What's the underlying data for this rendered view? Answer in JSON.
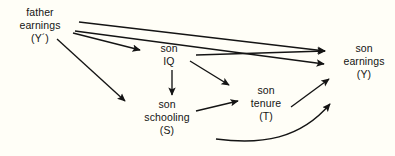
{
  "figure": {
    "type": "path-diagram",
    "background_color": "#fffef7",
    "stroke_color": "#141414",
    "text_color": "#141414"
  },
  "nodes": [
    {
      "id": "father-earnings",
      "lines": [
        "father",
        "earnings",
        "(Y´)"
      ],
      "label": "father earnings (Y´)",
      "symbol": "Y´"
    },
    {
      "id": "son-iq",
      "lines": [
        "son",
        "IQ",
        ""
      ],
      "label": "son IQ",
      "symbol": ""
    },
    {
      "id": "son-schooling",
      "lines": [
        "son",
        "schooling",
        "(S)"
      ],
      "label": "son schooling (S)",
      "symbol": "S"
    },
    {
      "id": "son-tenure",
      "lines": [
        "son",
        "tenure",
        "(T)"
      ],
      "label": "son tenure (T)",
      "symbol": "T"
    },
    {
      "id": "son-earnings",
      "lines": [
        "son",
        "earnings",
        "(Y)"
      ],
      "label": "son earnings (Y)",
      "symbol": "Y"
    }
  ],
  "edges": [
    {
      "id": "father-earnings-to-son-earnings-upper",
      "from": "father-earnings",
      "to": "son-earnings",
      "style": "straight"
    },
    {
      "id": "father-earnings-to-son-earnings-lower",
      "from": "father-earnings",
      "to": "son-earnings",
      "style": "straight"
    },
    {
      "id": "father-earnings-to-son-iq",
      "from": "father-earnings",
      "to": "son-iq",
      "style": "straight"
    },
    {
      "id": "father-earnings-to-son-schooling",
      "from": "father-earnings",
      "to": "son-schooling",
      "style": "straight"
    },
    {
      "id": "son-iq-to-son-earnings",
      "from": "son-iq",
      "to": "son-earnings",
      "style": "straight"
    },
    {
      "id": "son-iq-to-son-tenure",
      "from": "son-iq",
      "to": "son-tenure",
      "style": "straight"
    },
    {
      "id": "son-iq-to-son-schooling",
      "from": "son-iq",
      "to": "son-schooling",
      "style": "straight"
    },
    {
      "id": "son-schooling-to-son-tenure",
      "from": "son-schooling",
      "to": "son-tenure",
      "style": "straight"
    },
    {
      "id": "son-tenure-to-son-earnings",
      "from": "son-tenure",
      "to": "son-earnings",
      "style": "straight"
    },
    {
      "id": "son-schooling-to-son-earnings",
      "from": "son-schooling",
      "to": "son-earnings",
      "style": "curved"
    }
  ]
}
